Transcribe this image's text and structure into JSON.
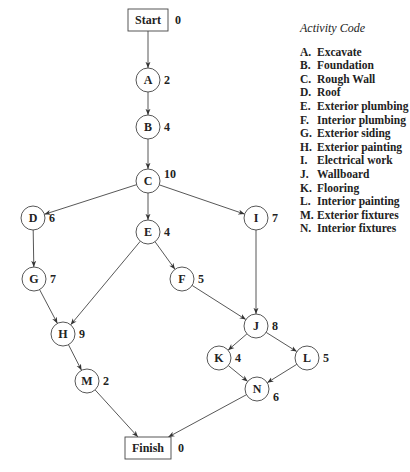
{
  "legend": {
    "title": "Activity Code",
    "items": [
      {
        "code": "A.",
        "name": "Excavate"
      },
      {
        "code": "B.",
        "name": "Foundation"
      },
      {
        "code": "C.",
        "name": "Rough Wall"
      },
      {
        "code": "D.",
        "name": "Roof"
      },
      {
        "code": "E.",
        "name": "Exterior plumbing"
      },
      {
        "code": "F.",
        "name": "Interior plumbing"
      },
      {
        "code": "G.",
        "name": "Exterior siding"
      },
      {
        "code": "H.",
        "name": "Exterior painting"
      },
      {
        "code": "I.",
        "name": "Electrical work"
      },
      {
        "code": "J.",
        "name": "Wallboard"
      },
      {
        "code": "K.",
        "name": "Flooring"
      },
      {
        "code": "L.",
        "name": "Interior painting"
      },
      {
        "code": "M.",
        "name": "Exterior fixtures"
      },
      {
        "code": "N.",
        "name": "Interior fixtures"
      }
    ]
  },
  "nodes": [
    {
      "id": "Start",
      "label": "Start",
      "duration": "0",
      "shape": "box",
      "x": 148,
      "y": 20
    },
    {
      "id": "A",
      "label": "A",
      "duration": "2",
      "shape": "circle",
      "x": 148,
      "y": 80
    },
    {
      "id": "B",
      "label": "B",
      "duration": "4",
      "shape": "circle",
      "x": 148,
      "y": 127
    },
    {
      "id": "C",
      "label": "C",
      "duration": "10",
      "shape": "circle",
      "x": 148,
      "y": 181
    },
    {
      "id": "D",
      "label": "D",
      "duration": "6",
      "shape": "circle",
      "x": 33,
      "y": 218
    },
    {
      "id": "E",
      "label": "E",
      "duration": "4",
      "shape": "circle",
      "x": 148,
      "y": 232
    },
    {
      "id": "I",
      "label": "I",
      "duration": "7",
      "shape": "circle",
      "x": 256,
      "y": 218
    },
    {
      "id": "G",
      "label": "G",
      "duration": "7",
      "shape": "circle",
      "x": 34,
      "y": 279
    },
    {
      "id": "F",
      "label": "F",
      "duration": "5",
      "shape": "circle",
      "x": 182,
      "y": 279
    },
    {
      "id": "H",
      "label": "H",
      "duration": "9",
      "shape": "circle",
      "x": 63,
      "y": 334
    },
    {
      "id": "J",
      "label": "J",
      "duration": "8",
      "shape": "circle",
      "x": 256,
      "y": 326
    },
    {
      "id": "M",
      "label": "M",
      "duration": "2",
      "shape": "circle",
      "x": 87,
      "y": 381
    },
    {
      "id": "K",
      "label": "K",
      "duration": "4",
      "shape": "circle",
      "x": 219,
      "y": 358
    },
    {
      "id": "L",
      "label": "L",
      "duration": "5",
      "shape": "circle",
      "x": 307,
      "y": 358
    },
    {
      "id": "N",
      "label": "N",
      "duration": "6",
      "shape": "circle",
      "x": 257,
      "y": 389
    },
    {
      "id": "Finish",
      "label": "Finish",
      "duration": "0",
      "shape": "box",
      "x": 148,
      "y": 448
    }
  ],
  "edges": [
    [
      "Start",
      "A"
    ],
    [
      "A",
      "B"
    ],
    [
      "B",
      "C"
    ],
    [
      "C",
      "D"
    ],
    [
      "C",
      "E"
    ],
    [
      "C",
      "I"
    ],
    [
      "D",
      "G"
    ],
    [
      "G",
      "H"
    ],
    [
      "E",
      "H"
    ],
    [
      "E",
      "F"
    ],
    [
      "F",
      "J"
    ],
    [
      "I",
      "J"
    ],
    [
      "H",
      "M"
    ],
    [
      "J",
      "K"
    ],
    [
      "J",
      "L"
    ],
    [
      "K",
      "N"
    ],
    [
      "L",
      "N"
    ],
    [
      "M",
      "Finish"
    ],
    [
      "N",
      "Finish"
    ]
  ]
}
